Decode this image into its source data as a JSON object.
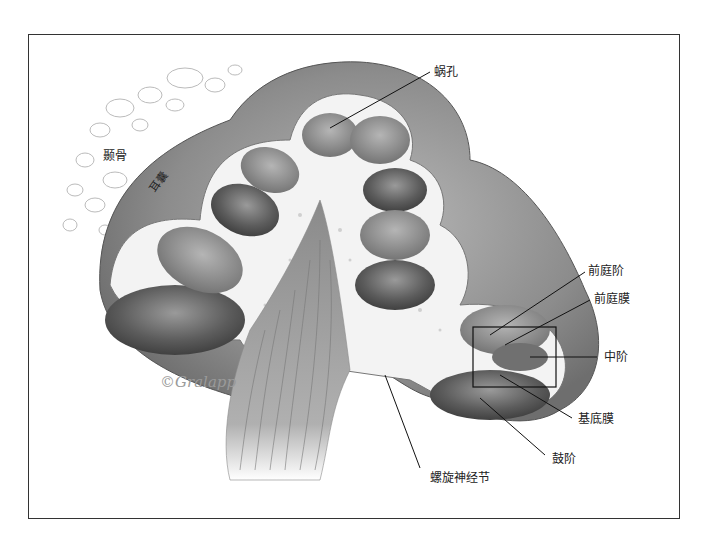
{
  "figure": {
    "signature": "©Gralapp",
    "colors": {
      "frame": "#333333",
      "background": "#ffffff",
      "tissue_dark": "#4a4a4a",
      "tissue_mid": "#8a8a8a",
      "bone": "#f4f4f4"
    }
  },
  "labels": {
    "temporal_bone": "颞骨",
    "otic_capsule": "耳囊",
    "helicotrema": "蜗孔",
    "scala_vestibuli": "前庭阶",
    "vestibular_membrane": "前庭膜",
    "scala_media": "中阶",
    "basilar_membrane": "基底膜",
    "scala_tympani": "鼓阶",
    "spiral_ganglion": "螺旋神经节"
  }
}
